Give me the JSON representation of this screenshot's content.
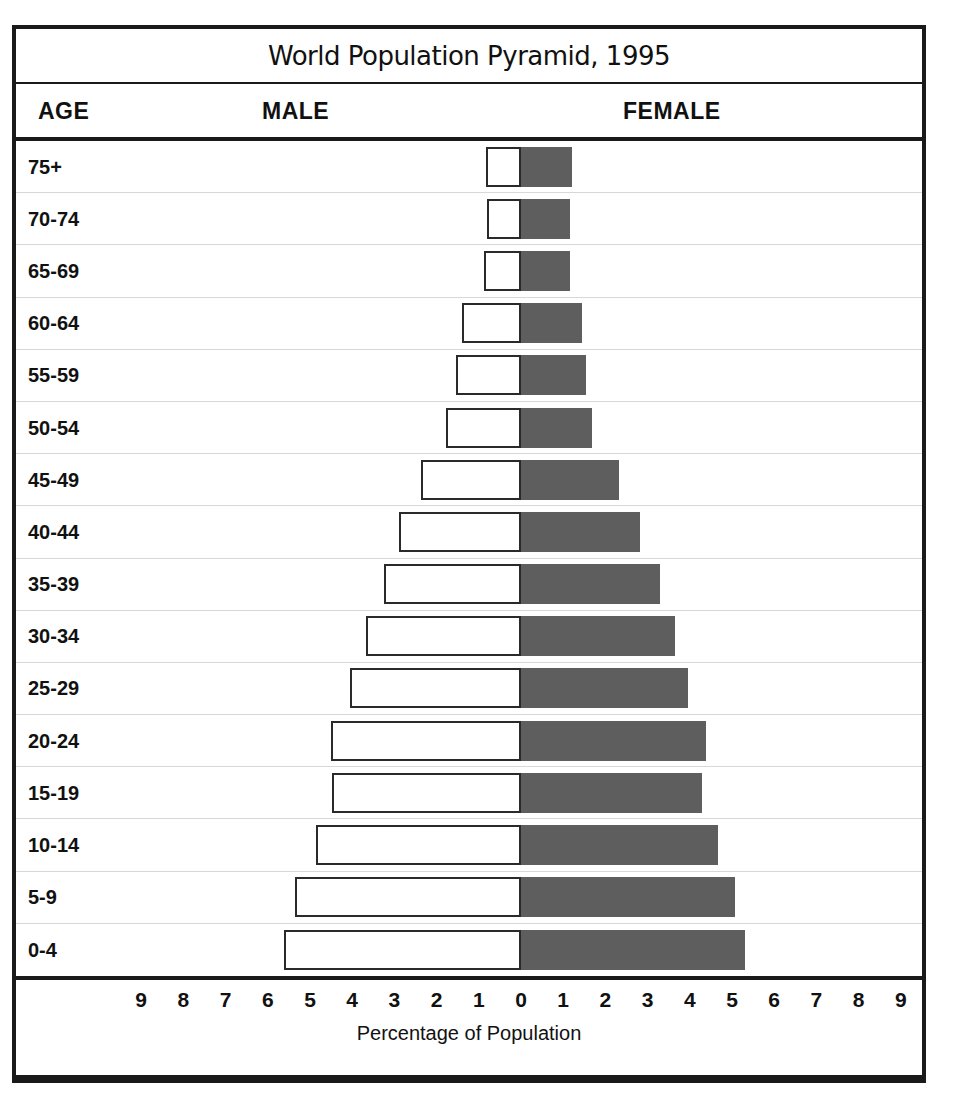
{
  "chart_data": {
    "type": "bar",
    "subtype": "population-pyramid",
    "title": "World Population Pyramid, 1995",
    "xlabel": "Percentage of Population",
    "ylabel": "AGE",
    "xlim": [
      -9,
      9
    ],
    "grid": true,
    "legend_position": "column-headers",
    "axis_ticks": [
      9,
      8,
      7,
      6,
      5,
      4,
      3,
      2,
      1,
      0,
      1,
      2,
      3,
      4,
      5,
      6,
      7,
      8,
      9
    ],
    "axis_tick_unit": "percent",
    "categories": [
      "75+",
      "70-74",
      "65-69",
      "60-64",
      "55-59",
      "50-54",
      "45-49",
      "40-44",
      "35-39",
      "30-34",
      "25-29",
      "20-24",
      "15-19",
      "10-14",
      "5-9",
      "0-4"
    ],
    "series": [
      {
        "name": "MALE",
        "side": "left",
        "fill": "#ffffff",
        "stroke": "#2a2a2a",
        "values": [
          0.83,
          0.8,
          0.88,
          1.4,
          1.55,
          1.78,
          2.37,
          2.9,
          3.25,
          3.67,
          4.05,
          4.5,
          4.48,
          4.86,
          5.36,
          5.62
        ]
      },
      {
        "name": "FEMALE",
        "side": "right",
        "fill": "#5e5e5e",
        "stroke": "#5e5e5e",
        "values": [
          1.2,
          1.16,
          1.16,
          1.45,
          1.55,
          1.68,
          2.32,
          2.82,
          3.3,
          3.65,
          3.96,
          4.38,
          4.29,
          4.67,
          5.07,
          5.3
        ]
      }
    ]
  },
  "header": {
    "title": "World Population Pyramid, 1995",
    "col_age": "AGE",
    "col_male": "MALE",
    "col_female": "FEMALE"
  },
  "axis": {
    "title": "Percentage of Population",
    "ticks": [
      "9",
      "8",
      "7",
      "6",
      "5",
      "4",
      "3",
      "2",
      "1",
      "0",
      "1",
      "2",
      "3",
      "4",
      "5",
      "6",
      "7",
      "8",
      "9"
    ]
  },
  "colors": {
    "male_fill": "#ffffff",
    "male_stroke": "#2a2a2a",
    "female_fill": "#5e5e5e",
    "frame": "#1a1a1a",
    "gridline": "#d8d8d8",
    "background": "#ffffff"
  }
}
